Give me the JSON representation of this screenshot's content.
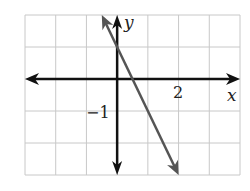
{
  "chart_data": {
    "type": "line",
    "title": "",
    "xlabel": "x",
    "ylabel": "y",
    "xlim": [
      -3,
      4
    ],
    "ylim": [
      -3,
      2
    ],
    "grid": true,
    "tick_labels": {
      "x": [
        "2"
      ],
      "y": [
        "−1"
      ]
    },
    "series": [
      {
        "name": "y = -2x + 1",
        "equation": "y = -2x + 1",
        "slope": -2,
        "intercept": 1,
        "points": [
          [
            -0.5,
            2
          ],
          [
            0,
            1
          ],
          [
            0.5,
            0
          ],
          [
            1,
            -1
          ],
          [
            2,
            -3
          ]
        ]
      }
    ],
    "colors": {
      "line": "#555555",
      "axes": "#111111",
      "grid": "#c8c8c8"
    }
  },
  "labels": {
    "x_axis": "x",
    "y_axis": "y",
    "x_tick": "2",
    "y_tick": "−1"
  }
}
